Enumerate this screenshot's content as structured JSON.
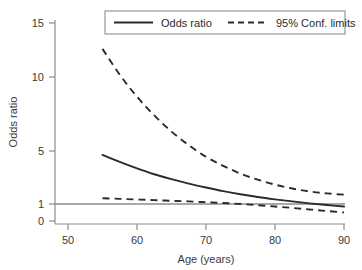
{
  "chart_data": {
    "type": "line",
    "title": "",
    "xlabel": "Age (years)",
    "ylabel": "Odds ratio",
    "xlim": [
      48,
      91
    ],
    "ylim": [
      0,
      15
    ],
    "xticks": [
      50,
      60,
      70,
      80,
      90
    ],
    "yticks": [
      0,
      1,
      5,
      10,
      15
    ],
    "grid": false,
    "legend_position": "top",
    "reference_line": {
      "y": 1,
      "color": "#8c8c8c",
      "style": "solid"
    },
    "x": [
      55,
      57.5,
      60,
      62.5,
      65,
      67.5,
      70,
      72.5,
      75,
      77.5,
      80,
      82.5,
      85,
      87.5,
      90
    ],
    "series": [
      {
        "name": "Odds ratio",
        "style": "solid",
        "color": "#2b2b2b",
        "values": [
          4.8,
          4.25,
          3.75,
          3.3,
          2.92,
          2.58,
          2.28,
          2.0,
          1.75,
          1.54,
          1.36,
          1.2,
          1.05,
          0.94,
          0.85
        ]
      },
      {
        "name": "95% Conf. limits (upper)",
        "style": "dashed",
        "color": "#2b2b2b",
        "values": [
          13.0,
          11.0,
          9.3,
          7.85,
          6.6,
          5.55,
          4.65,
          3.95,
          3.35,
          2.88,
          2.5,
          2.2,
          1.97,
          1.82,
          1.72
        ]
      },
      {
        "name": "95% Conf. limits (lower)",
        "style": "dashed",
        "color": "#2b2b2b",
        "values": [
          1.45,
          1.4,
          1.35,
          1.3,
          1.25,
          1.2,
          1.14,
          1.08,
          1.0,
          0.93,
          0.85,
          0.77,
          0.68,
          0.59,
          0.5
        ]
      }
    ],
    "legend": [
      {
        "label": "Odds ratio",
        "style": "solid"
      },
      {
        "label": "95% Conf. limits",
        "style": "dashed"
      }
    ]
  },
  "axes": {
    "y_title": "Odds ratio",
    "x_title": "Age (years)",
    "y_tick_labels": [
      "15",
      "10",
      "5",
      "1",
      "0"
    ],
    "x_tick_labels": [
      "50",
      "60",
      "70",
      "80",
      "90"
    ]
  },
  "legend": {
    "odds_ratio_label": "Odds ratio",
    "conf_limits_label": "95% Conf. limits"
  },
  "colors": {
    "axis": "#8c8c8c",
    "curve": "#2b2b2b",
    "reference": "#9a9a9a",
    "text": "#3a3a3a",
    "background": "#ffffff"
  }
}
